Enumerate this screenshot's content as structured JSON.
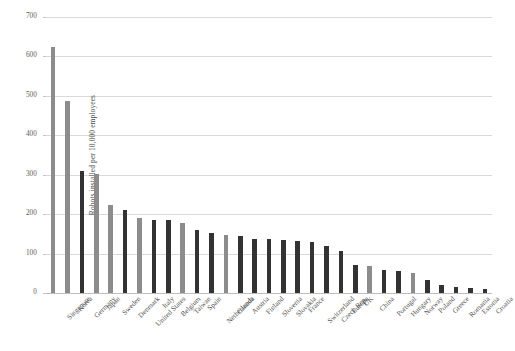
{
  "chart_data": {
    "type": "bar",
    "title": "",
    "xlabel": "",
    "ylabel": "Robots installed per 10,000 employees",
    "ylim": [
      0,
      700
    ],
    "yticks": [
      0,
      100,
      200,
      300,
      400,
      500,
      600,
      700
    ],
    "ytick_labels": [
      "0",
      "100",
      "200",
      "300",
      "400",
      "500",
      "600",
      "700"
    ],
    "grid": true,
    "legend": "none",
    "categories": [
      "Singapore",
      "Korea",
      "Germany",
      "Japan",
      "Sweden",
      "Denmark",
      "United States",
      "Italy",
      "Belgium",
      "Taiwan",
      "Spain",
      "Netherlands",
      "Canada",
      "Austria",
      "Finland",
      "Slovenia",
      "Slovakia",
      "France",
      "Switzerland",
      "Czech Rep.",
      "Europe",
      "UK",
      "China",
      "Portugal",
      "Hungary",
      "Norway",
      "Poland",
      "Greece",
      "Romania",
      "Estonia",
      "Croatia"
    ],
    "values": [
      625,
      488,
      309,
      303,
      223,
      211,
      189,
      185,
      184,
      177,
      160,
      153,
      148,
      144,
      138,
      137,
      135,
      132,
      129,
      119,
      106,
      71,
      68,
      58,
      57,
      51,
      32,
      20,
      15,
      12,
      10
    ],
    "bar_colors": [
      "#8c8c8c",
      "#8c8c8c",
      "#333333",
      "#8c8c8c",
      "#8c8c8c",
      "#333333",
      "#8c8c8c",
      "#333333",
      "#333333",
      "#8c8c8c",
      "#333333",
      "#333333",
      "#8c8c8c",
      "#333333",
      "#333333",
      "#333333",
      "#333333",
      "#333333",
      "#333333",
      "#333333",
      "#333333",
      "#333333",
      "#8c8c8c",
      "#333333",
      "#333333",
      "#8c8c8c",
      "#333333",
      "#333333",
      "#333333",
      "#333333",
      "#333333"
    ],
    "colors": {
      "gray_bar": "#8c8c8c",
      "dark_bar": "#333333",
      "gridline": "#d9d9d9",
      "axis": "#bdbdbd",
      "tick_text": "#5a5a5a",
      "label_text": "#4f4f4f",
      "background": "#ffffff"
    }
  }
}
